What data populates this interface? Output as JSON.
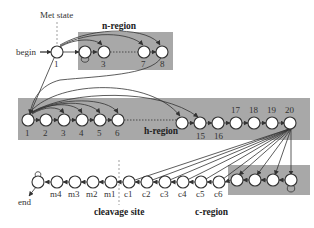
{
  "diagram": {
    "title_labels": {
      "met_state": "Met state",
      "begin": "begin",
      "end": "end",
      "cleavage_site": "cleavage site"
    },
    "regions": [
      {
        "name": "n-region",
        "label": "n-region"
      },
      {
        "name": "h-region",
        "label": "h-region"
      },
      {
        "name": "c-region",
        "label": "c-region"
      }
    ],
    "n_region_nodes": [
      "1",
      "",
      "3",
      "7",
      "8"
    ],
    "h_region_nodes_left": [
      "1",
      "2",
      "3",
      "4",
      "5",
      "6"
    ],
    "h_region_nodes_right": [
      "15",
      "16",
      "17",
      "18",
      "19",
      "20"
    ],
    "c_chain_nodes": [
      "m4",
      "m3",
      "m2",
      "m1",
      "c1",
      "c2",
      "c3",
      "c4",
      "c5",
      "c6"
    ],
    "colors": {
      "region_fill": "#a8a8a8",
      "node_stroke": "#333333",
      "node_fill": "#ffffff"
    }
  }
}
